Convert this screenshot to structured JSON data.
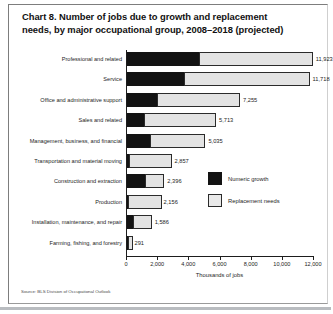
{
  "chart_data": {
    "type": "bar",
    "orientation": "horizontal",
    "stacked": true,
    "title": "Chart 8. Number of jobs due to growth and replacement needs, by major occupational group, 2008–2018 (projected)",
    "xlabel": "Thousands of jobs",
    "ylabel": "",
    "xlim": [
      0,
      12000
    ],
    "xticks": [
      0,
      2000,
      4000,
      6000,
      8000,
      10000,
      12000
    ],
    "xtick_labels": [
      "0",
      "2,000",
      "4,000",
      "6,000",
      "8,000",
      "10,000",
      "12,000"
    ],
    "grid": false,
    "legend_position": "center-right",
    "categories": [
      "Professional and related",
      "Service",
      "Office and administrative support",
      "Sales and related",
      "Management, business, and financial",
      "Transportation and material moving",
      "Construction and extraction",
      "Production",
      "Installation, maintenance, and repair",
      "Farming, fishing, and forestry"
    ],
    "series": [
      {
        "name": "Numeric growth",
        "color": "#131313",
        "values": [
          4702,
          3736,
          2005,
          1137,
          1511,
          167,
          1189,
          40,
          469,
          26
        ]
      },
      {
        "name": "Replacement needs",
        "color": "#e3e3e3",
        "values": [
          7221,
          7982,
          5250,
          4576,
          3524,
          2690,
          1207,
          2116,
          1117,
          265
        ]
      }
    ],
    "totals": [
      11923,
      11718,
      7255,
      5713,
      5035,
      2857,
      2396,
      2156,
      1586,
      291
    ],
    "total_labels": [
      "11,923",
      "11,718",
      "7,255",
      "5,713",
      "5,035",
      "2,857",
      "2,396",
      "2,156",
      "1,586",
      "291"
    ],
    "source": "Source: BLS Division of Occupational Outlook"
  },
  "legend": {
    "items": [
      {
        "label": "Numeric growth",
        "swatch": "growth"
      },
      {
        "label": "Replacement needs",
        "swatch": "replace"
      }
    ]
  }
}
